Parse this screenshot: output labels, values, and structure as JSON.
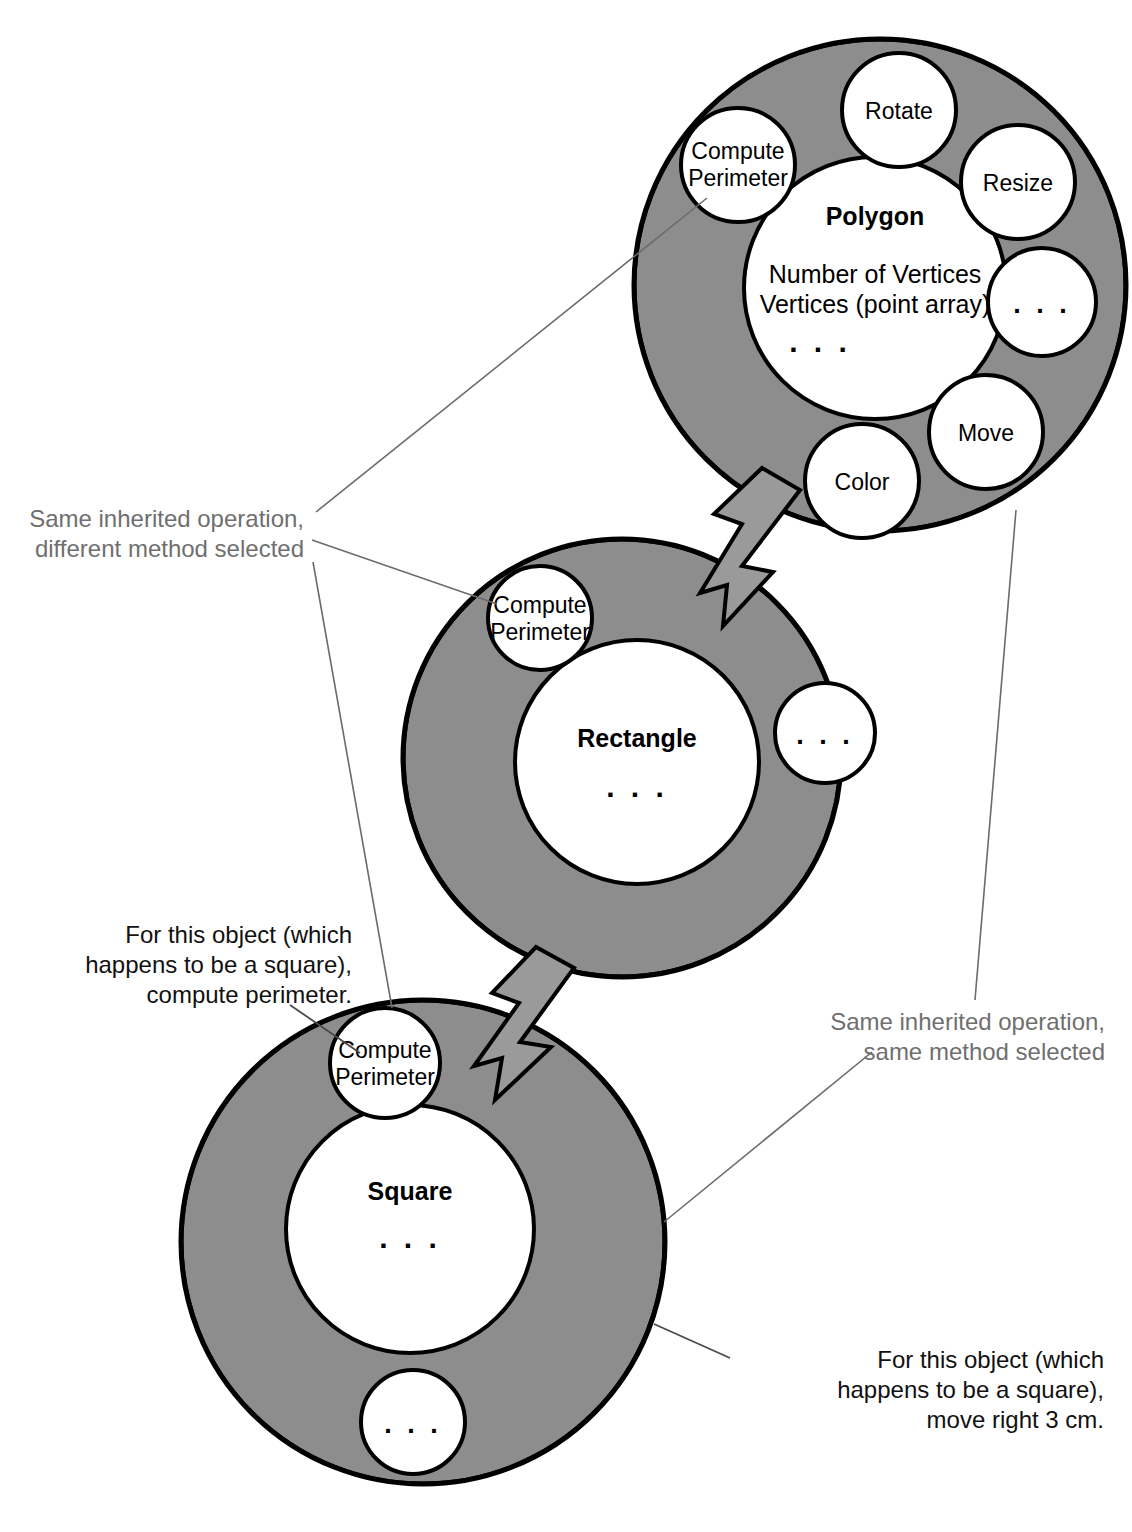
{
  "diagram": {
    "colors": {
      "ring_fill": "#8d8d8d",
      "bubble_fill": "#ffffff",
      "outline": "#000000",
      "arrow_fill": "#9a9a9a",
      "leader_gray": "#6f6f6f",
      "note_dark": "#111111",
      "background": "#ffffff"
    },
    "ellipsis": ". . .",
    "classes": [
      {
        "id": "polygon",
        "name": "Polygon",
        "attributes": [
          "Number of Vertices",
          "Vertices (point array)"
        ],
        "attributes_ellipsis": ". . .",
        "operations": [
          {
            "id": "compute-perimeter",
            "label_line1": "Compute",
            "label_line2": "Perimeter"
          },
          {
            "id": "rotate",
            "label_line1": "Rotate",
            "label_line2": ""
          },
          {
            "id": "resize",
            "label_line1": "Resize",
            "label_line2": ""
          },
          {
            "id": "more-ops-right",
            "label_line1": ". . .",
            "label_line2": ""
          },
          {
            "id": "move",
            "label_line1": "Move",
            "label_line2": ""
          },
          {
            "id": "color",
            "label_line1": "Color",
            "label_line2": ""
          }
        ]
      },
      {
        "id": "rectangle",
        "name": "Rectangle",
        "attributes": [],
        "attributes_ellipsis": ". . .",
        "operations": [
          {
            "id": "compute-perimeter",
            "label_line1": "Compute",
            "label_line2": "Perimeter"
          },
          {
            "id": "more-ops",
            "label_line1": ". . .",
            "label_line2": ""
          }
        ]
      },
      {
        "id": "square",
        "name": "Square",
        "attributes": [],
        "attributes_ellipsis": ". . .",
        "operations": [
          {
            "id": "compute-perimeter",
            "label_line1": "Compute",
            "label_line2": "Perimeter"
          },
          {
            "id": "more-ops",
            "label_line1": ". . .",
            "label_line2": ""
          }
        ]
      }
    ],
    "annotations": [
      {
        "id": "same-op-diff-method",
        "line1": "Same inherited operation,",
        "line2": "different method selected"
      },
      {
        "id": "compute-perimeter-message",
        "line1": "For this object (which",
        "line2": "happens to be a square),",
        "line3": "compute perimeter."
      },
      {
        "id": "same-op-same-method",
        "line1": "Same inherited operation,",
        "line2": "same method selected"
      },
      {
        "id": "move-message",
        "line1": "For this object (which",
        "line2": "happens to be a square),",
        "line3": "move right 3 cm."
      }
    ]
  }
}
